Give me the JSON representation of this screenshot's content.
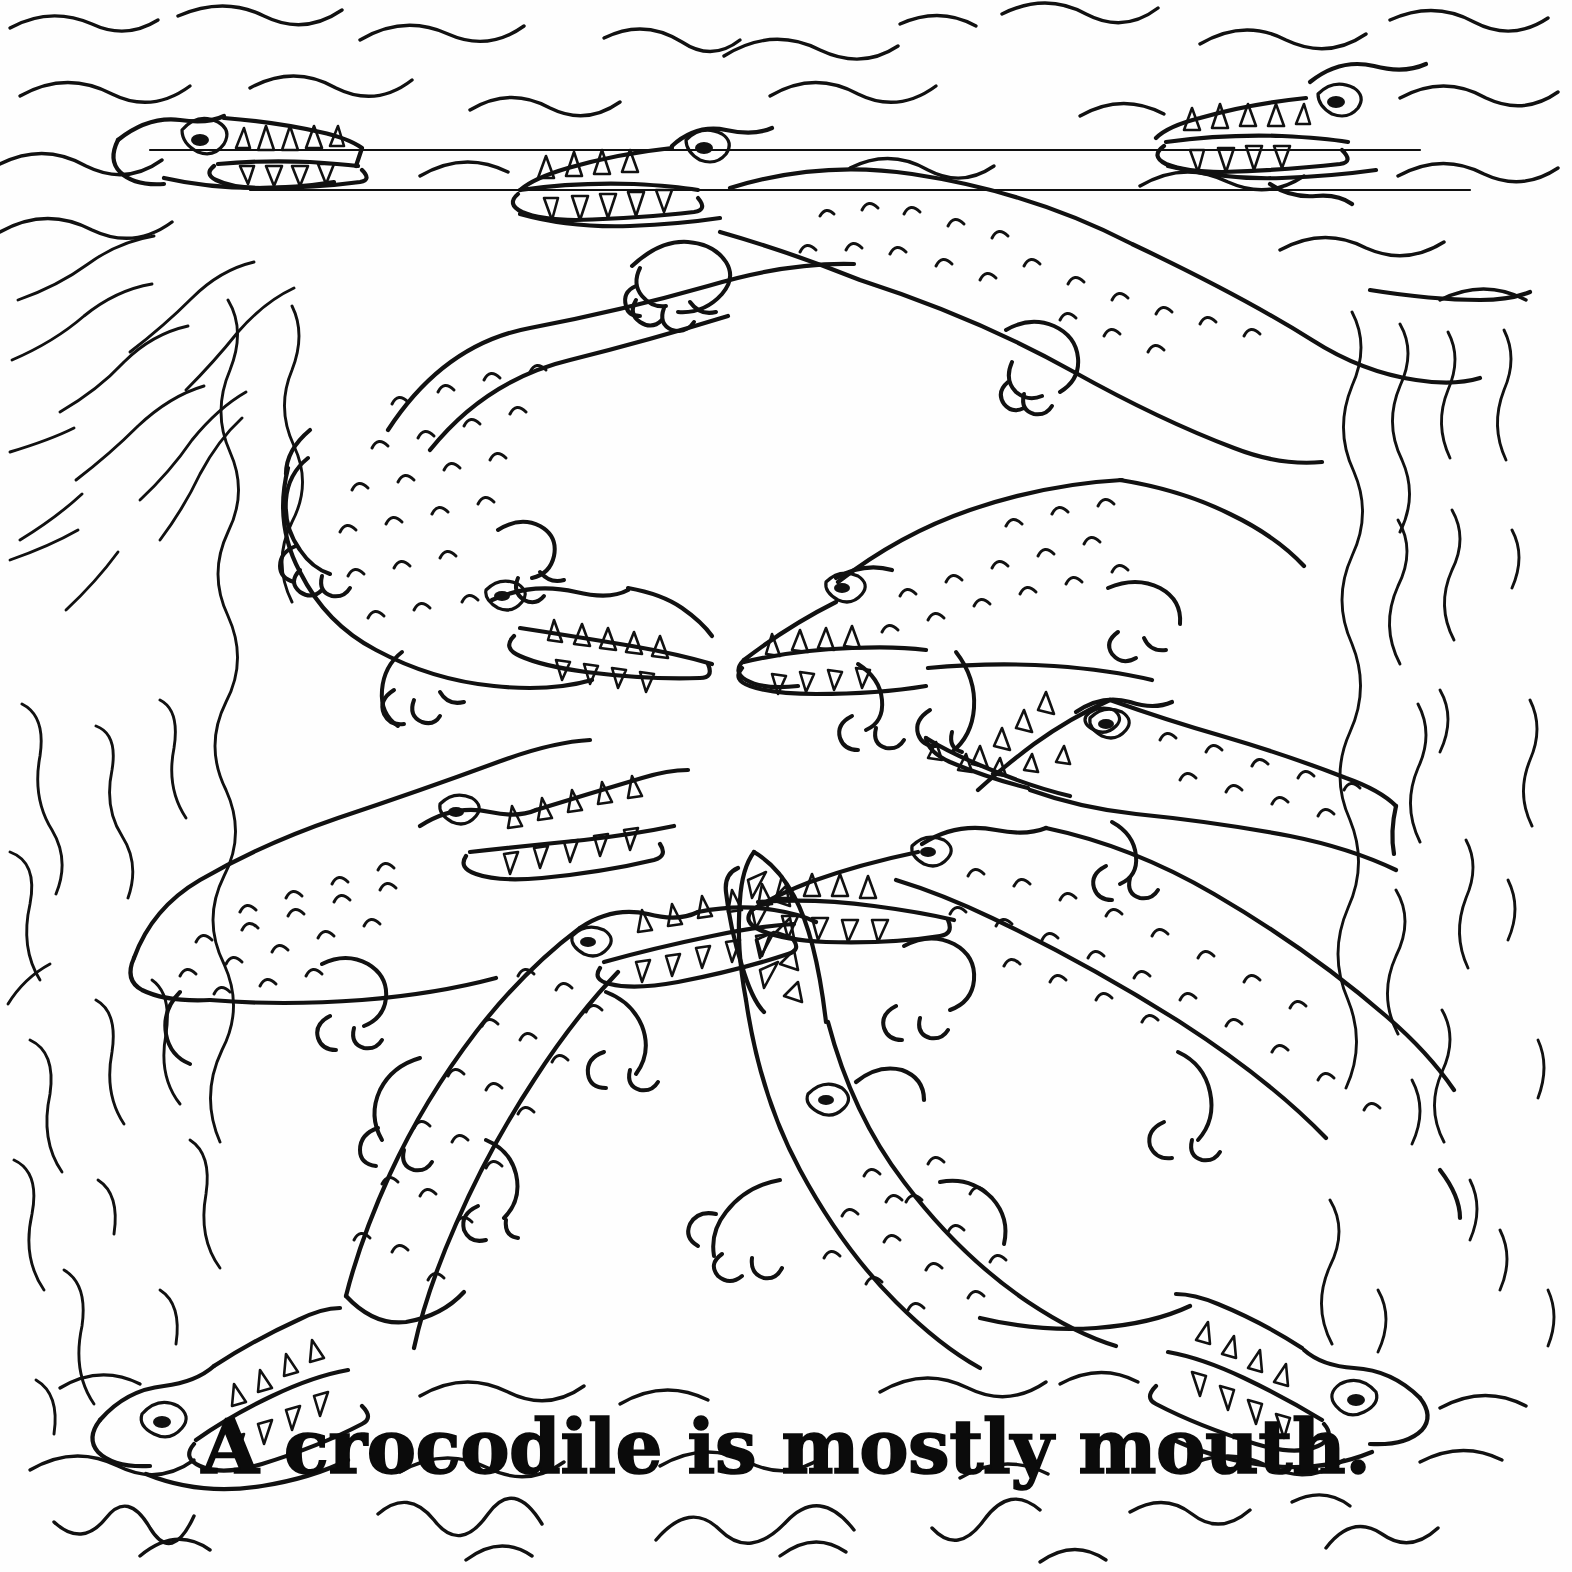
{
  "page": {
    "kind": "coloring-book-page",
    "background_color": "#fefefe",
    "ink_color": "#111111",
    "width": 1572,
    "height": 1572
  },
  "caption": {
    "text": "A crocodile is mostly mouth.",
    "color": "#0b0b0b"
  },
  "scene": {
    "title": "A crocodile is mostly mouth.",
    "subject": "crocodiles",
    "setting": "water",
    "style": "hand-drawn black line art, uncolored",
    "crocodile_count": 14,
    "full_body_count": 7,
    "head_only_count": 7
  },
  "crocodiles": [
    {
      "id": "croc-top-left-head",
      "type": "head-only",
      "facing": "right",
      "mouth": "open",
      "position": "top-left"
    },
    {
      "id": "croc-top-center-head",
      "type": "head-only",
      "facing": "left",
      "mouth": "open",
      "position": "top-center"
    },
    {
      "id": "croc-top-right-head",
      "type": "head-only",
      "facing": "left",
      "mouth": "open",
      "position": "top-right"
    },
    {
      "id": "croc-upper-large",
      "type": "full-body",
      "facing": "left",
      "mouth": "open",
      "position": "upper-center"
    },
    {
      "id": "croc-left-upper",
      "type": "full-body",
      "facing": "right",
      "mouth": "open",
      "position": "left-upper"
    },
    {
      "id": "croc-right-upper",
      "type": "full-body",
      "facing": "left",
      "mouth": "open",
      "position": "right-upper"
    },
    {
      "id": "croc-right-middle",
      "type": "full-body",
      "facing": "left",
      "mouth": "open",
      "position": "right-middle"
    },
    {
      "id": "croc-left-middle",
      "type": "full-body",
      "facing": "right",
      "mouth": "open",
      "position": "left-middle"
    },
    {
      "id": "croc-center-right-big",
      "type": "full-body",
      "facing": "left",
      "mouth": "open",
      "position": "center-right"
    },
    {
      "id": "croc-lower-left-diving",
      "type": "full-body",
      "facing": "right",
      "mouth": "open",
      "position": "lower-left"
    },
    {
      "id": "croc-lower-center-rising",
      "type": "full-body",
      "facing": "up",
      "mouth": "open",
      "position": "lower-center"
    },
    {
      "id": "croc-bottom-left-head",
      "type": "head-only",
      "facing": "right",
      "mouth": "open",
      "position": "bottom-left"
    },
    {
      "id": "croc-bottom-right-head",
      "type": "head-only",
      "facing": "left",
      "mouth": "open",
      "position": "bottom-right"
    },
    {
      "id": "croc-mid-right-head",
      "type": "head-only",
      "facing": "left",
      "mouth": "open",
      "position": "mid-right"
    }
  ],
  "water": {
    "top_waves": "horizontal wavy strokes",
    "bottom_waves": "horizontal wavy strokes",
    "left_current": "vertical wavy strokes",
    "right_current": "vertical wavy strokes"
  }
}
